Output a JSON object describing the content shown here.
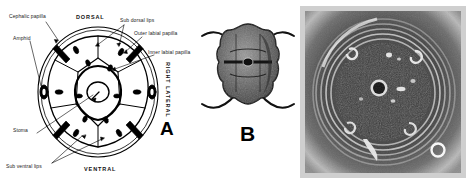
{
  "figure": {
    "caption_type": "nematode-head-en-face-plate",
    "panels": [
      {
        "id": "A",
        "letter": "A",
        "kind": "line-diagram"
      },
      {
        "id": "B",
        "letter": "B",
        "kind": "light-micrograph"
      },
      {
        "id": "C",
        "letter": "",
        "kind": "scanning-electron-micrograph"
      }
    ]
  },
  "panel_a": {
    "letter": "A",
    "orientation": {
      "dorsal": "DORSAL",
      "ventral": "VENTRAL",
      "left_lateral": "LEFT LATERAL",
      "right_lateral": "RIGHT LATERAL"
    },
    "labels": {
      "cephalic_papilla": "Cephalic papilla",
      "amphid": "Amphid",
      "stoma": "Stoma",
      "sub_ventral_lips": "Sub ventral lips",
      "sub_dorsal_lips": "Sub dorsal lips",
      "outer_labial_papilla": "Outer labial papilla",
      "inner_labial_papilla": "Inner labial papilla"
    },
    "structure": {
      "lip_count": 6,
      "outer_ring": "cuticular head margin",
      "center": "triradiate stoma opening"
    }
  },
  "panel_b": {
    "letter": "B",
    "description": "dark lobed nematode head with four curved setae"
  },
  "panel_c": {
    "letter": "",
    "description": "SEM en face view with concentric annules, central stoma and papillae"
  },
  "colors": {
    "ink": "#000000",
    "label_text": "#1a1a1a",
    "page_background": "#ffffff",
    "micrograph_border": "#cfcfcf",
    "micrograph_mid": "#7a7a7a",
    "micrograph_dark": "#3a3a3a"
  }
}
